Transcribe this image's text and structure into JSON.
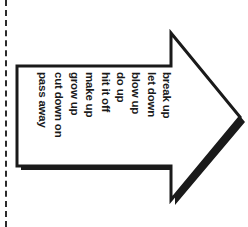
{
  "figure": {
    "type": "arrow-diagram",
    "direction": "right",
    "background_color": "#ffffff",
    "outline_color": "#1a1a1a",
    "shadow_color": "#1a1a1a",
    "fill_color": "#ffffff"
  },
  "margin_rule": {
    "name": "dashed-margin-line",
    "orientation": "vertical",
    "color": "#2b2b2b",
    "style": "dashed"
  },
  "verbs": [
    {
      "label": "break up",
      "x": 171
    },
    {
      "label": "let down",
      "x": 156
    },
    {
      "label": "blow up",
      "x": 140
    },
    {
      "label": "do up",
      "x": 125
    },
    {
      "label": "hit it off",
      "x": 110
    },
    {
      "label": "make up",
      "x": 94
    },
    {
      "label": "grow up",
      "x": 79
    },
    {
      "label": "cut down on",
      "x": 63
    },
    {
      "label": "pass away",
      "x": 47
    }
  ]
}
